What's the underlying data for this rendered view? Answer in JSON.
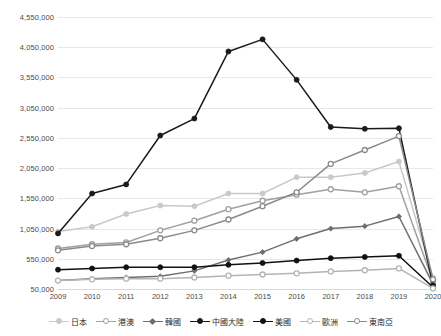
{
  "chart_data": {
    "type": "line",
    "title": "",
    "xlabel": "",
    "ylabel": "",
    "grid": true,
    "legend_position": "bottom",
    "x": [
      2009,
      2010,
      2011,
      2012,
      2013,
      2014,
      2015,
      2016,
      2017,
      2018,
      2019,
      2020
    ],
    "categories": [
      "2009",
      "2010",
      "2011",
      "2012",
      "2013",
      "2014",
      "2015",
      "2016",
      "2017",
      "2018",
      "2019",
      "2020"
    ],
    "ylim": [
      50000,
      4550000
    ],
    "yticks": [
      50000,
      550000,
      1050000,
      1550000,
      2050000,
      2550000,
      3050000,
      3550000,
      4050000,
      4550000
    ],
    "ytick_labels": [
      "50,000",
      "550,000",
      "1,050,000",
      "1,550,000",
      "2,050,000",
      "2,550,000",
      "3,050,000",
      "3,550,000",
      "4,050,000",
      "4,550,000"
    ],
    "series": [
      {
        "name": "日本",
        "color": "#c9c9c9",
        "marker": "filled-circle",
        "values": [
          1000000,
          1080000,
          1290000,
          1430000,
          1420000,
          1630000,
          1630000,
          1900000,
          1900000,
          1970000,
          2160000,
          240000
        ]
      },
      {
        "name": "港澳",
        "color": "#a0a0a0",
        "marker": "open-circle",
        "values": [
          720000,
          790000,
          820000,
          1020000,
          1180000,
          1370000,
          1510000,
          1610000,
          1700000,
          1650000,
          1750000,
          180000
        ]
      },
      {
        "name": "韓國",
        "color": "#6e6e6e",
        "marker": "filled-diamond",
        "values": [
          190000,
          220000,
          240000,
          260000,
          350000,
          530000,
          660000,
          880000,
          1050000,
          1090000,
          1250000,
          130000
        ]
      },
      {
        "name": "中國大陸",
        "color": "#1a1a1a",
        "marker": "filled-circle",
        "values": [
          970000,
          1630000,
          1780000,
          2590000,
          2870000,
          3980000,
          4180000,
          3510000,
          2730000,
          2700000,
          2710000,
          110000
        ]
      },
      {
        "name": "美國",
        "color": "#111111",
        "marker": "filled-circle",
        "values": [
          370000,
          390000,
          410000,
          410000,
          410000,
          450000,
          480000,
          520000,
          560000,
          580000,
          600000,
          80000
        ]
      },
      {
        "name": "歐洲",
        "color": "#b4b4b4",
        "marker": "open-circle",
        "values": [
          190000,
          210000,
          220000,
          220000,
          240000,
          270000,
          290000,
          310000,
          340000,
          360000,
          390000,
          60000
        ]
      },
      {
        "name": "東南亞",
        "color": "#8a8a8a",
        "marker": "open-circle",
        "values": [
          690000,
          760000,
          790000,
          890000,
          1020000,
          1200000,
          1420000,
          1650000,
          2120000,
          2350000,
          2580000,
          210000
        ]
      }
    ]
  },
  "legend": {
    "items": [
      {
        "label": "日本",
        "color": "#c9c9c9",
        "marker": "filled-circle"
      },
      {
        "label": "港澳",
        "color": "#a0a0a0",
        "marker": "open-circle"
      },
      {
        "label": "韓國",
        "color": "#6e6e6e",
        "marker": "filled-diamond"
      },
      {
        "label": "中國大陸",
        "color": "#1a1a1a",
        "marker": "filled-circle"
      },
      {
        "label": "美國",
        "color": "#111111",
        "marker": "filled-circle"
      },
      {
        "label": "歐洲",
        "color": "#b4b4b4",
        "marker": "open-circle"
      },
      {
        "label": "東南亞",
        "color": "#8a8a8a",
        "marker": "open-circle"
      }
    ]
  }
}
